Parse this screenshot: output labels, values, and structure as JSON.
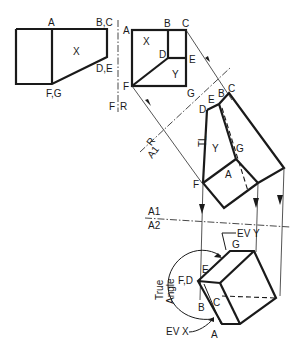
{
  "diagram": {
    "type": "auxiliary-view-dihedral-angle",
    "views": {
      "front": {
        "labels": {
          "top_left": "A",
          "top_right": "B,C",
          "middle_right": "D,E",
          "bottom": "F,G",
          "surface": "X"
        }
      },
      "right_side": {
        "labels": {
          "a": "A",
          "b": "B",
          "c": "C",
          "d": "D",
          "e": "E",
          "f": "F",
          "g": "G",
          "surface_x": "X",
          "surface_y": "Y"
        }
      },
      "auxiliary_1": {
        "labels": {
          "c": "C",
          "b": "B",
          "e": "E",
          "d": "D",
          "g": "G",
          "a": "A",
          "f": "F",
          "surface_y": "Y",
          "true_length": "TL"
        }
      },
      "auxiliary_2": {
        "labels": {
          "g": "G",
          "e": "E",
          "fd": "F,D",
          "b": "B",
          "c": "C",
          "a": "A",
          "ev_y": "EV Y",
          "ev_x": "EV X",
          "true_angle_line1": "True",
          "true_angle_line2": "Angle"
        }
      }
    },
    "fold_lines": {
      "f_r": {
        "top": "F",
        "bottom": "R"
      },
      "r_a1": {
        "top": "R",
        "bottom": "A1"
      },
      "a1_a2": {
        "top": "A1",
        "bottom": "A2"
      }
    }
  }
}
